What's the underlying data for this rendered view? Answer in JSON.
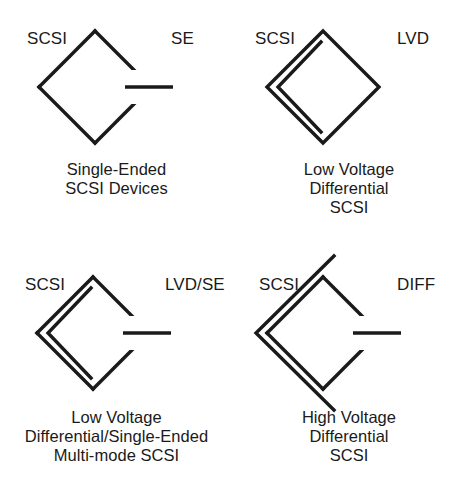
{
  "figure": {
    "background_color": "#ffffff",
    "ink_color": "#1a1a1a"
  },
  "symbols": [
    {
      "id": "single-ended",
      "left_label": "SCSI",
      "right_label": "SE",
      "caption_lines": [
        "Single-Ended",
        "SCSI Devices"
      ],
      "has_inner_chevron": false,
      "has_horizontal_bar": true,
      "chevron_overshoot": false
    },
    {
      "id": "low-voltage-differential",
      "left_label": "SCSI",
      "right_label": "LVD",
      "caption_lines": [
        "Low Voltage",
        "Differential",
        "SCSI"
      ],
      "has_inner_chevron": true,
      "has_horizontal_bar": false,
      "chevron_overshoot": false
    },
    {
      "id": "low-voltage-differential-single-ended",
      "left_label": "SCSI",
      "right_label": "LVD/SE",
      "caption_lines": [
        "Low Voltage",
        "Differential/Single-Ended",
        "Multi-mode SCSI"
      ],
      "has_inner_chevron": true,
      "has_horizontal_bar": true,
      "chevron_overshoot": false
    },
    {
      "id": "high-voltage-differential",
      "left_label": "SCSI",
      "right_label": "DIFF",
      "caption_lines": [
        "High Voltage",
        "Differential",
        "SCSI"
      ],
      "has_inner_chevron": true,
      "has_horizontal_bar": true,
      "chevron_overshoot": true
    }
  ]
}
